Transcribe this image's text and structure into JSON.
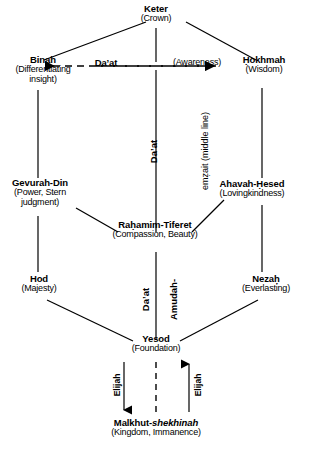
{
  "diagram": {
    "ink_color": "#000000",
    "background": "#ffffff"
  },
  "nodes": [
    {
      "id": "keter",
      "name": "Keter",
      "gloss": "(Crown)"
    },
    {
      "id": "binah",
      "name": "Binah",
      "gloss": "(Differentiating",
      "gloss2": "insight)"
    },
    {
      "id": "hokhmah",
      "name": "Ḥokhmah",
      "gloss": "(Wisdom)"
    },
    {
      "id": "gevurah",
      "name": "Gevurah-Din",
      "gloss": "(Power, Stern",
      "gloss2": "judgment)"
    },
    {
      "id": "hesed",
      "name": "Ahavah-Ḥesed",
      "gloss": "(Lovingkindness)"
    },
    {
      "id": "tiferet",
      "name": "Raḥamim-Tiferet",
      "gloss": "(Compassion, Beauty)"
    },
    {
      "id": "hod",
      "name": "Hod",
      "gloss": "(Majesty)"
    },
    {
      "id": "nezah",
      "name": "Nezaḥ",
      "gloss": "(Everlasting)"
    },
    {
      "id": "yesod",
      "name": "Yesod",
      "gloss": "(Foundation)"
    },
    {
      "id": "malkhut",
      "name": "Malkhut-",
      "name_italic": "shekhinah",
      "gloss": "(Kingdom, Immanence)"
    }
  ],
  "annotations": {
    "daat_label": "Da’at",
    "awareness_label": "(Awareness)",
    "middle_line_bold": "Da’at",
    "middle_line_rest": "emẓait (middle line)",
    "amudah_bold": "Da’at",
    "amudah_rest": "Amudah-",
    "elijah_left": "Elijah",
    "elijah_right": "Elijah"
  }
}
